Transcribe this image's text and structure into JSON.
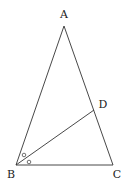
{
  "diagram": {
    "type": "triangle",
    "points": {
      "A": {
        "label": "A",
        "x": 64,
        "y": 26,
        "lx": 64,
        "ly": 18
      },
      "B": {
        "label": "B",
        "x": 16,
        "y": 165,
        "lx": 11,
        "ly": 178
      },
      "C": {
        "label": "C",
        "x": 113,
        "y": 165,
        "lx": 117,
        "ly": 178
      },
      "D": {
        "label": "D",
        "x": 94,
        "y": 110,
        "lx": 103,
        "ly": 108
      }
    },
    "segments": [
      "AB",
      "AC",
      "BC",
      "BD"
    ],
    "angle_marks": {
      "symbol": "o",
      "vertex": "B",
      "description": "Equal angles ABD and DBC (BD bisects angle B)"
    },
    "colors": {
      "stroke": "#333333",
      "text": "#222222",
      "background": "#ffffff"
    }
  }
}
